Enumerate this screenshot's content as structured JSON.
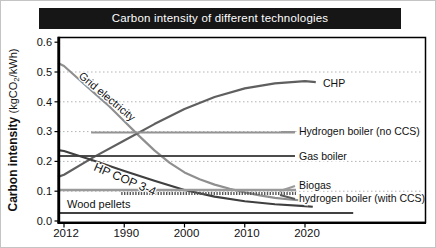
{
  "title": "Carbon intensity of different technologies",
  "y_axis": {
    "label_bold": "Carbon intensity",
    "units_prefix": "(kgCO",
    "units_sub": "2",
    "units_suffix": "/kWh)",
    "ticks": [
      "0.6",
      "0.5",
      "0.4",
      "0.3",
      "0.2",
      "0.1",
      "0.0"
    ],
    "tick_values": [
      0.6,
      0.5,
      0.4,
      0.3,
      0.2,
      0.1,
      0.0
    ]
  },
  "x_axis": {
    "ticks": [
      "2012",
      "1990",
      "2000",
      "2010",
      "2020"
    ]
  },
  "colors": {
    "title_bg": "#161616",
    "title_text": "#ffffff",
    "frame": "#000000",
    "grid": "#b3b3b3",
    "text": "#111111"
  },
  "chart_data": {
    "type": "line",
    "title": "Carbon intensity of different technologies",
    "ylabel": "Carbon intensity (kgCO2/kWh)",
    "xlabel": "",
    "x_tick_labels": [
      "2012",
      "1990",
      "2000",
      "2010",
      "2020"
    ],
    "x_unit": "tick-index (0 = first tick)",
    "ylim": [
      0.0,
      0.62
    ],
    "grid_values": [
      0.1,
      0.2,
      0.3,
      0.4,
      0.5
    ],
    "grid_style": "dotted",
    "legend_position": "right-side inline labels",
    "series": [
      {
        "id": "grid-electricity",
        "name": "Grid electricity",
        "color": "#8f8f8f",
        "width": 2.2,
        "points": [
          [
            -0.1,
            0.53
          ],
          [
            0,
            0.52
          ],
          [
            0.25,
            0.475
          ],
          [
            0.5,
            0.43
          ],
          [
            0.75,
            0.385
          ],
          [
            1,
            0.335
          ],
          [
            1.25,
            0.285
          ],
          [
            1.5,
            0.237
          ],
          [
            1.75,
            0.196
          ],
          [
            2,
            0.163
          ],
          [
            2.25,
            0.14
          ],
          [
            2.5,
            0.122
          ],
          [
            2.75,
            0.108
          ],
          [
            3,
            0.096
          ],
          [
            3.25,
            0.086
          ],
          [
            3.5,
            0.078
          ],
          [
            3.75,
            0.072
          ],
          [
            4,
            0.068
          ],
          [
            4.1,
            0.066
          ]
        ],
        "inline_label": {
          "text": "Grid electricity",
          "x": 77,
          "y": 76,
          "rotation": 40,
          "size": 11
        }
      },
      {
        "id": "chp",
        "name": "CHP",
        "color": "#5f5f5f",
        "width": 2.2,
        "points": [
          [
            -0.1,
            0.148
          ],
          [
            0,
            0.155
          ],
          [
            0.5,
            0.215
          ],
          [
            1,
            0.27
          ],
          [
            1.5,
            0.325
          ],
          [
            2,
            0.376
          ],
          [
            2.5,
            0.416
          ],
          [
            3,
            0.445
          ],
          [
            3.5,
            0.462
          ],
          [
            4,
            0.469
          ],
          [
            4.18,
            0.466
          ]
        ],
        "right_label": {
          "text": "CHP",
          "x": 322,
          "y": 86
        }
      },
      {
        "id": "hydrogen-no-ccs",
        "name": "Hydrogen boiler (no CCS)",
        "color": "#949494",
        "width": 2.2,
        "points": [
          [
            0.45,
            0.297
          ],
          [
            3.83,
            0.297
          ]
        ],
        "right_label": {
          "text": "Hydrogen boiler (no CCS)",
          "x": 298,
          "y": 134
        },
        "dash": {
          "x1": 280,
          "y1": 131,
          "x2": 294,
          "y2": 131
        }
      },
      {
        "id": "gas-boiler",
        "name": "Gas boiler",
        "color": "#4c4c4c",
        "width": 1.8,
        "points": [
          [
            -0.1,
            0.218
          ],
          [
            3.83,
            0.218
          ]
        ],
        "right_label": {
          "text": "Gas boiler",
          "x": 298,
          "y": 159
        },
        "dash": {
          "x1": 280,
          "y1": 155,
          "x2": 294,
          "y2": 155
        }
      },
      {
        "id": "hp-cop-3-4",
        "name": "HP COP 3-4",
        "color": "#3f3f3f",
        "width": 2.1,
        "points": [
          [
            -0.1,
            0.238
          ],
          [
            0,
            0.235
          ],
          [
            0.5,
            0.202
          ],
          [
            1,
            0.168
          ],
          [
            1.5,
            0.135
          ],
          [
            2,
            0.104
          ],
          [
            2.5,
            0.082
          ],
          [
            3,
            0.066
          ],
          [
            3.5,
            0.056
          ],
          [
            4,
            0.05
          ],
          [
            4.13,
            0.048
          ]
        ],
        "inline_label": {
          "text": "HP COP 3-4",
          "x": 92,
          "y": 169,
          "rotation": 23,
          "size": 12
        }
      },
      {
        "id": "biogas",
        "name": "Biogas",
        "color": "#9a9a9a",
        "width": 2.4,
        "points": [
          [
            -0.1,
            0.104
          ],
          [
            3.85,
            0.104
          ]
        ],
        "right_label": {
          "text": "Biogas",
          "x": 298,
          "y": 188
        },
        "dash": {
          "x1": 279,
          "y1": 190,
          "x2": 294,
          "y2": 185
        }
      },
      {
        "id": "hydrogen-with-ccs",
        "name": "hydrogen boiler (with CCS)",
        "color": "#585858",
        "width": 3,
        "dasharray": "1.4 1.4",
        "points": [
          [
            0.95,
            0.092
          ],
          [
            3.85,
            0.092
          ]
        ],
        "right_label": {
          "text": "hydrogen boiler (with CCS)",
          "x": 298,
          "y": 201
        },
        "dash": {
          "x1": 279,
          "y1": 194,
          "x2": 294,
          "y2": 198
        }
      },
      {
        "id": "wood-pellets",
        "name": "Wood pellets",
        "color": "#414141",
        "width": 1.8,
        "points": [
          [
            -0.1,
            0.027
          ],
          [
            4.8,
            0.027
          ]
        ],
        "inline_label": {
          "text": "Wood pellets",
          "x": 66,
          "y": 207,
          "rotation": 0,
          "size": 11
        }
      }
    ]
  }
}
